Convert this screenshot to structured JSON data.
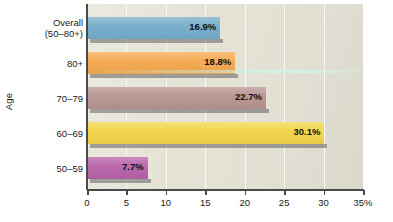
{
  "chart_data": {
    "type": "bar",
    "orientation": "horizontal",
    "title": "",
    "xlabel": "",
    "ylabel": "Age",
    "xlim": [
      0,
      35
    ],
    "xticks": [
      {
        "value": 0,
        "label": "0"
      },
      {
        "value": 5,
        "label": "5"
      },
      {
        "value": 10,
        "label": "10"
      },
      {
        "value": 15,
        "label": "15"
      },
      {
        "value": 20,
        "label": "20"
      },
      {
        "value": 25,
        "label": "25"
      },
      {
        "value": 30,
        "label": "30"
      },
      {
        "value": 35,
        "label": "35%"
      }
    ],
    "grid": "vertical",
    "legend": "none",
    "categories": [
      "Overall (50–80+)",
      "80+",
      "70–79",
      "60–69",
      "50–59"
    ],
    "values": [
      16.9,
      18.8,
      22.7,
      30.1,
      7.7
    ],
    "bars": [
      {
        "category_line1": "Overall",
        "category_line2": "(50–80+)",
        "value": 16.9,
        "value_label": "16.9%",
        "color": "#74ADC9",
        "label_inside": true
      },
      {
        "category_line1": "80+",
        "category_line2": "",
        "value": 18.8,
        "value_label": "18.8%",
        "color": "#F6A94F",
        "label_inside": true
      },
      {
        "category_line1": "70–79",
        "category_line2": "",
        "value": 22.7,
        "value_label": "22.7%",
        "color": "#B8948F",
        "label_inside": true
      },
      {
        "category_line1": "60–69",
        "category_line2": "",
        "value": 30.1,
        "value_label": "30.1%",
        "color": "#F3D548",
        "label_inside": true
      },
      {
        "category_line1": "50–59",
        "category_line2": "",
        "value": 7.7,
        "value_label": "7.7%",
        "color": "#B763A9",
        "label_inside": true
      }
    ],
    "colors": {
      "plot_background": "#E9E7D9",
      "figure_background": "#FFFFFF",
      "axis": "#4A4A4A",
      "gridline": "#FFFFFF",
      "text": "#1A1A1A",
      "bar_shadow": "#606060"
    }
  }
}
